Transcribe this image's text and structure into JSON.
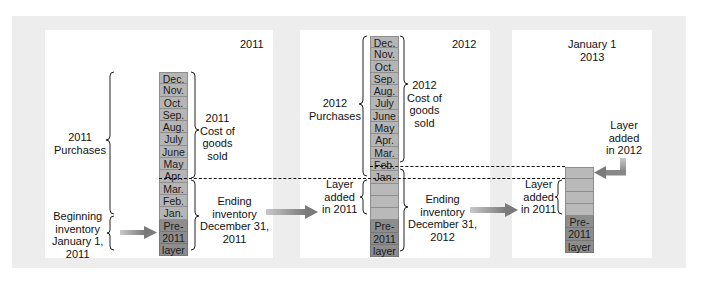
{
  "colors": {
    "panel_bg": "#ffffff",
    "outer_bg": "#ededed",
    "month_cell": "#b5b5b5",
    "pre2011_cell": "#8d8d8d",
    "arrow": "#8a8a8a"
  },
  "panels": [
    {
      "title": "2011",
      "purchases_label": "2011\nPurchases",
      "cogs_label": "2011\nCost of\ngoods\nsold",
      "beginning_label": "Beginning\ninventory\nJanuary 1,\n2011",
      "ending_label": "Ending\ninventory\nDecember 31,\n2011",
      "column": [
        "Dec.",
        "Nov.",
        "Oct.",
        "Sep.",
        "Aug.",
        "July",
        "June",
        "May",
        "Apr.",
        "Mar.",
        "Feb.",
        "Jan.",
        "Pre-",
        "2011",
        "layer"
      ]
    },
    {
      "title": "2012",
      "purchases_label": "2012\nPurchases",
      "cogs_label": "2012\nCost of\ngoods\nsold",
      "layer_label": "Layer\nadded\nin 2011",
      "ending_label": "Ending\ninventory\nDecember 31,\n2012",
      "column": [
        "Dec.",
        "Nov.",
        "Oct.",
        "Sep.",
        "Aug.",
        "July",
        "June",
        "May",
        "Apr.",
        "Mar.",
        "Feb.",
        "Jan.",
        "",
        "",
        "",
        "Pre-",
        "2011",
        "layer"
      ]
    },
    {
      "title": "January 1\n2013",
      "layer_2012_label": "Layer\nadded\nin 2012",
      "layer_2011_label": "Layer\nadded\nin 2011",
      "column": [
        "",
        "",
        "",
        "",
        "Pre-",
        "2011",
        "layer"
      ]
    }
  ]
}
